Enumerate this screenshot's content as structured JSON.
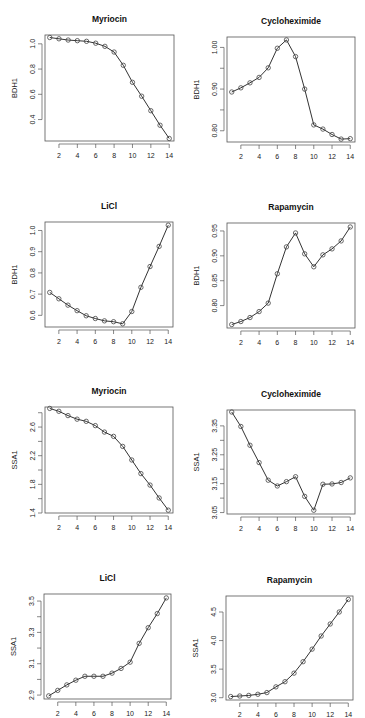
{
  "chart_data": [
    {
      "type": "line",
      "title": "Myriocin",
      "xlabel": "",
      "ylabel": "BDH1",
      "x": [
        1,
        2,
        3,
        4,
        5,
        6,
        7,
        8,
        9,
        10,
        11,
        12,
        13,
        14
      ],
      "values": [
        1.05,
        1.04,
        1.03,
        1.025,
        1.02,
        1.005,
        0.98,
        0.935,
        0.83,
        0.695,
        0.585,
        0.47,
        0.355,
        0.25
      ],
      "xticks": [
        2,
        4,
        6,
        8,
        10,
        12,
        14
      ],
      "yticks": [
        0.4,
        0.6,
        0.8,
        1.0
      ],
      "ytick_labels": [
        "0.4",
        "0.6",
        "0.8",
        "1.0"
      ],
      "ylim": [
        0.23,
        1.07
      ],
      "grid": false
    },
    {
      "type": "line",
      "title": "Cycloheximide",
      "xlabel": "",
      "ylabel": "BDH1",
      "x": [
        1,
        2,
        3,
        4,
        5,
        6,
        7,
        8,
        9,
        10,
        11,
        12,
        13,
        14
      ],
      "values": [
        0.893,
        0.903,
        0.915,
        0.928,
        0.951,
        0.998,
        1.018,
        0.978,
        0.9,
        0.814,
        0.804,
        0.791,
        0.78,
        0.781
      ],
      "xticks": [
        2,
        4,
        6,
        8,
        10,
        12,
        14
      ],
      "yticks": [
        0.8,
        0.85,
        0.9,
        0.95,
        1.0
      ],
      "ytick_labels": [
        "0.80",
        "",
        "0.90",
        "",
        "1.00"
      ],
      "ylim": [
        0.773,
        1.025
      ],
      "grid": false
    },
    {
      "type": "line",
      "title": "LiCl",
      "xlabel": "",
      "ylabel": "BDH1",
      "x": [
        1,
        2,
        3,
        4,
        5,
        6,
        7,
        8,
        9,
        10,
        11,
        12,
        13,
        14
      ],
      "values": [
        0.708,
        0.678,
        0.648,
        0.622,
        0.598,
        0.585,
        0.574,
        0.57,
        0.56,
        0.618,
        0.732,
        0.83,
        0.925,
        1.025
      ],
      "xticks": [
        2,
        4,
        6,
        8,
        10,
        12,
        14
      ],
      "yticks": [
        0.6,
        0.7,
        0.8,
        0.9,
        1.0
      ],
      "ytick_labels": [
        "0.6",
        "0.7",
        "0.8",
        "0.9",
        "1.0"
      ],
      "ylim": [
        0.545,
        1.04
      ],
      "grid": false
    },
    {
      "type": "line",
      "title": "Rapamycin",
      "xlabel": "",
      "ylabel": "BDH1",
      "x": [
        1,
        2,
        3,
        4,
        5,
        6,
        7,
        8,
        9,
        10,
        11,
        12,
        13,
        14
      ],
      "values": [
        0.762,
        0.768,
        0.776,
        0.788,
        0.805,
        0.864,
        0.918,
        0.946,
        0.904,
        0.878,
        0.902,
        0.914,
        0.93,
        0.958
      ],
      "xticks": [
        2,
        4,
        6,
        8,
        10,
        12,
        14
      ],
      "yticks": [
        0.8,
        0.85,
        0.9,
        0.95
      ],
      "ytick_labels": [
        "0.80",
        "0.85",
        "0.90",
        "0.95"
      ],
      "ylim": [
        0.755,
        0.966
      ],
      "grid": false
    },
    {
      "type": "line",
      "title": "Myriocin",
      "xlabel": "",
      "ylabel": "SSA1",
      "x": [
        1,
        2,
        3,
        4,
        5,
        6,
        7,
        8,
        9,
        10,
        11,
        12,
        13,
        14
      ],
      "values": [
        2.86,
        2.82,
        2.76,
        2.71,
        2.68,
        2.62,
        2.53,
        2.47,
        2.33,
        2.14,
        1.95,
        1.79,
        1.61,
        1.44
      ],
      "xticks": [
        2,
        4,
        6,
        8,
        10,
        12,
        14
      ],
      "yticks": [
        1.4,
        1.6,
        1.8,
        2.0,
        2.2,
        2.4,
        2.6,
        2.8
      ],
      "ytick_labels": [
        "1.4",
        "",
        "1.8",
        "",
        "2.2",
        "",
        "2.6",
        ""
      ],
      "ylim": [
        1.4,
        2.88
      ],
      "grid": false
    },
    {
      "type": "line",
      "title": "Cycloheximide",
      "xlabel": "",
      "ylabel": "SSA1",
      "x": [
        1,
        2,
        3,
        4,
        5,
        6,
        7,
        8,
        9,
        10,
        11,
        12,
        13,
        14
      ],
      "values": [
        3.398,
        3.348,
        3.283,
        3.223,
        3.162,
        3.142,
        3.157,
        3.174,
        3.106,
        3.058,
        3.148,
        3.149,
        3.154,
        3.17
      ],
      "xticks": [
        2,
        4,
        6,
        8,
        10,
        12,
        14
      ],
      "yticks": [
        3.05,
        3.1,
        3.15,
        3.2,
        3.25,
        3.3,
        3.35
      ],
      "ytick_labels": [
        "3.05",
        "",
        "3.15",
        "",
        "3.25",
        "",
        "3.35"
      ],
      "ylim": [
        3.045,
        3.405
      ],
      "grid": false
    },
    {
      "type": "line",
      "title": "LiCl",
      "xlabel": "",
      "ylabel": "SSA1",
      "x": [
        1,
        2,
        3,
        4,
        5,
        6,
        7,
        8,
        9,
        10,
        11,
        12,
        13,
        14
      ],
      "values": [
        2.895,
        2.93,
        2.965,
        2.995,
        3.02,
        3.02,
        3.02,
        3.04,
        3.07,
        3.11,
        3.23,
        3.33,
        3.42,
        3.52
      ],
      "xticks": [
        2,
        4,
        6,
        8,
        10,
        12,
        14
      ],
      "yticks": [
        2.9,
        3.0,
        3.1,
        3.2,
        3.3,
        3.4,
        3.5
      ],
      "ytick_labels": [
        "2.9",
        "",
        "3.1",
        "",
        "3.3",
        "",
        "3.5"
      ],
      "ylim": [
        2.875,
        3.545
      ],
      "grid": false
    },
    {
      "type": "line",
      "title": "Rapamycin",
      "xlabel": "",
      "ylabel": "SSA1",
      "x": [
        1,
        2,
        3,
        4,
        5,
        6,
        7,
        8,
        9,
        10,
        11,
        12,
        13,
        14
      ],
      "values": [
        3.02,
        3.03,
        3.04,
        3.06,
        3.09,
        3.19,
        3.28,
        3.43,
        3.63,
        3.85,
        4.08,
        4.29,
        4.5,
        4.72
      ],
      "xticks": [
        2,
        4,
        6,
        8,
        10,
        12,
        14
      ],
      "yticks": [
        3.0,
        3.5,
        4.0,
        4.5
      ],
      "ytick_labels": [
        "3.0",
        "3.5",
        "4.0",
        "4.5"
      ],
      "ylim": [
        2.96,
        4.78
      ],
      "grid": false
    }
  ],
  "layout": {
    "panels": [
      {
        "left": 0,
        "top": 0,
        "box": [
          45,
          35,
          174,
          141
        ]
      },
      {
        "left": 182,
        "top": 0,
        "box": [
          45,
          37,
          173,
          142
        ]
      },
      {
        "left": 0,
        "top": 180,
        "box": [
          45,
          42,
          173,
          147
        ]
      },
      {
        "left": 182,
        "top": 180,
        "box": [
          45,
          43,
          173,
          148
        ]
      },
      {
        "left": 0,
        "top": 360,
        "box": [
          45,
          47,
          173,
          153
        ]
      },
      {
        "left": 182,
        "top": 360,
        "box": [
          45,
          50,
          173,
          154
        ]
      },
      {
        "left": 0,
        "top": 540,
        "box": [
          44,
          54,
          171,
          159
        ]
      },
      {
        "left": 182,
        "top": 540,
        "box": [
          44,
          56,
          171,
          160
        ]
      }
    ],
    "line_color": "#333333",
    "marker_color": "#444444",
    "axis_color": "#555555"
  }
}
